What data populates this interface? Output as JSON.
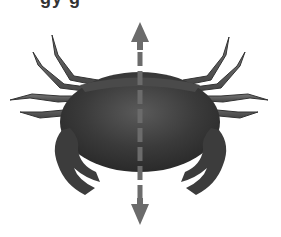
{
  "figure": {
    "caption_cropped": "gy g",
    "annotation": "vertical axis of bilateral symmetry",
    "arrow_color": "#6b6b6b",
    "body_color": "#3a3a3a"
  }
}
